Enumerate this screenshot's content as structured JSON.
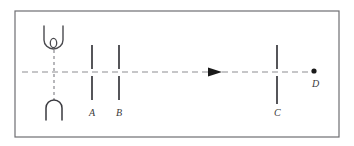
{
  "figure": {
    "background_color": "#ffffff",
    "border": {
      "color": "#6e6e72",
      "x": 15,
      "y": 11,
      "width": 324,
      "height": 126,
      "stroke_width": 1.2
    },
    "optical_axis": {
      "name": "optical-axis",
      "style": "dashed",
      "color": "#8d8d92",
      "y": 72,
      "x_start": 22,
      "x_end": 314,
      "dash": "6 4",
      "stroke_width": 1.1
    },
    "axis_arrow": {
      "name": "direction-arrow",
      "color": "#1a1a1a",
      "tip_x": 222,
      "tail_x": 208,
      "y": 72,
      "half_height": 4.5,
      "direction": "right"
    },
    "source": {
      "name": "light-source-assembly",
      "color": "#4a4a4f",
      "stem": {
        "style": "dashed",
        "x": 54,
        "y_top": 50,
        "y_bottom": 100,
        "dash": "3 3"
      },
      "lamp_holder": {
        "label": "u-bracket-open-up",
        "x_left": 44,
        "x_right": 63,
        "y_top": 26,
        "y_bottom": 48,
        "corner_radius": 8
      },
      "filament": {
        "label": "filament-loop",
        "cx": 53.5,
        "cy": 43,
        "rx": 3.2,
        "ry": 4.6
      },
      "base": {
        "label": "inverted-u-base",
        "x_left": 46,
        "x_right": 62,
        "y_top": 101,
        "y_bottom": 120,
        "corner_radius": 7
      }
    },
    "elements": [
      {
        "id": "A",
        "name": "slit-a",
        "label": "A",
        "x": 92,
        "y_top": 45,
        "y_bottom": 100,
        "gap_top": 69,
        "gap_bottom": 76,
        "label_x": 89,
        "label_y": 116,
        "color": "#2b2b30",
        "stroke_width": 1.6
      },
      {
        "id": "B",
        "name": "slit-b",
        "label": "B",
        "x": 119,
        "y_top": 45,
        "y_bottom": 100,
        "gap_top": 69,
        "gap_bottom": 76,
        "label_x": 116,
        "label_y": 116,
        "color": "#2b2b30",
        "stroke_width": 1.6
      },
      {
        "id": "C",
        "name": "slit-c",
        "label": "C",
        "x": 277,
        "y_top": 45,
        "y_bottom": 104,
        "gap_top": 69,
        "gap_bottom": 76,
        "label_x": 274,
        "label_y": 116,
        "color": "#2b2b30",
        "stroke_width": 1.6
      }
    ],
    "point": {
      "id": "D",
      "name": "point-d",
      "label": "D",
      "cx": 314,
      "cy": 71,
      "r": 2.6,
      "color": "#1a1a1a",
      "label_x": 312,
      "label_y": 87
    }
  }
}
